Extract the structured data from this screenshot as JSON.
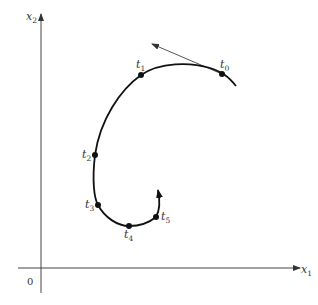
{
  "diagram": {
    "axes": {
      "x_label": "x",
      "x_sub": "1",
      "y_label": "x",
      "y_sub": "2",
      "origin_label": "0"
    },
    "trajectory_points": [
      {
        "label": "t",
        "sub": "0",
        "x": 222,
        "y": 74
      },
      {
        "label": "t",
        "sub": "1",
        "x": 141,
        "y": 75
      },
      {
        "label": "t",
        "sub": "2",
        "x": 95,
        "y": 155
      },
      {
        "label": "t",
        "sub": "3",
        "x": 98,
        "y": 205
      },
      {
        "label": "t",
        "sub": "4",
        "x": 129,
        "y": 226
      },
      {
        "label": "t",
        "sub": "5",
        "x": 156,
        "y": 217
      }
    ],
    "tangent_arrow": {
      "from": [
        222,
        74
      ],
      "to": [
        152,
        44
      ]
    },
    "colors": {
      "curve": "#111111",
      "axis": "#444444",
      "tangent": "#555555"
    }
  }
}
